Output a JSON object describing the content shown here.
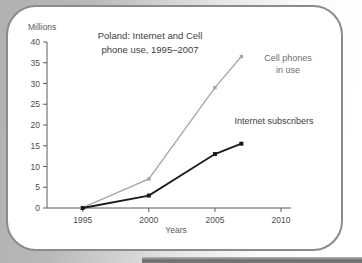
{
  "figure": {
    "unit_label": "Millions",
    "title_lines": [
      "Poland: Internet and Cell",
      "phone use, 1995–2007"
    ],
    "xaxis_title": "Years"
  },
  "colors": {
    "box_border": "#8b8b8b",
    "page_shadow_gray": "#b4b4b4",
    "bottom_bar_dark": "#6d6d6d",
    "axis": "#5a5a5a",
    "tick_text": "#4c4c4c",
    "cell_line": "#a6a6a6",
    "internet_line": "#1c1c1c"
  },
  "chart_data": {
    "type": "line",
    "title": "Poland: Internet and Cell phone use, 1995–2007",
    "xlabel": "Years",
    "ylabel": "Millions",
    "x": [
      1995,
      2000,
      2005,
      2007
    ],
    "series": [
      {
        "name": "Cell phones in use",
        "label_lines": [
          "Cell phones",
          "in use"
        ],
        "values": [
          0.1,
          7,
          29,
          36.5
        ],
        "color": "#a6a6a6",
        "marker": "square"
      },
      {
        "name": "Internet subscribers",
        "label_lines": [
          "Internet subscribers"
        ],
        "values": [
          0,
          3,
          13,
          15.5
        ],
        "color": "#1c1c1c",
        "marker": "square"
      }
    ],
    "x_ticks": [
      1995,
      2000,
      2005,
      2010
    ],
    "y_ticks": [
      0,
      5,
      10,
      15,
      20,
      25,
      30,
      35,
      40
    ],
    "xlim": [
      1992.3,
      2010.6
    ],
    "ylim": [
      0,
      40
    ],
    "grid": false,
    "legend_position": "inline-annotations"
  }
}
